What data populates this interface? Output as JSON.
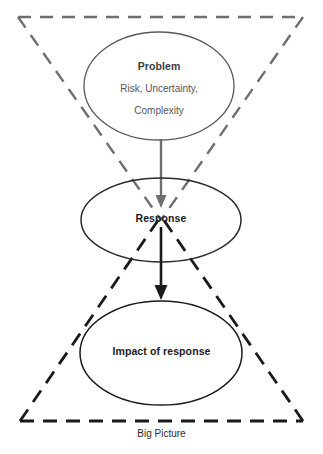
{
  "diagram": {
    "type": "hourglass-concept-diagram",
    "caption": "Big Picture",
    "colors": {
      "upper_triangle": "#6e6e6e",
      "lower_triangle": "#1a1a1a",
      "upper_arrow": "#6e6e6e",
      "lower_arrow": "#1a1a1a",
      "problem_ellipse_stroke": "#5a5a5a",
      "response_ellipse_stroke": "#2a2a2a",
      "impact_ellipse_stroke": "#1a1a1a",
      "background": "#ffffff"
    },
    "nodes": [
      {
        "id": "problem",
        "title": "Problem",
        "subtitle_line1": "Risk, Uncertainty,",
        "subtitle_line2": "Complexity",
        "shape": "ellipse"
      },
      {
        "id": "response",
        "title": "Response",
        "shape": "ellipse"
      },
      {
        "id": "impact",
        "title": "Impact of response",
        "shape": "ellipse"
      }
    ],
    "connectors": [
      {
        "id": "problem-to-response",
        "from": "problem",
        "to": "response",
        "style": "solid-arrow",
        "color": "#6e6e6e"
      },
      {
        "id": "response-to-impact",
        "from": "response",
        "to": "impact",
        "style": "solid-arrow",
        "color": "#1a1a1a"
      }
    ],
    "frames": [
      {
        "id": "upper-inverted-triangle",
        "style": "dashed",
        "color": "#6e6e6e",
        "orientation": "apex-down"
      },
      {
        "id": "lower-upright-triangle",
        "style": "dashed",
        "color": "#1a1a1a",
        "orientation": "apex-up"
      }
    ]
  }
}
